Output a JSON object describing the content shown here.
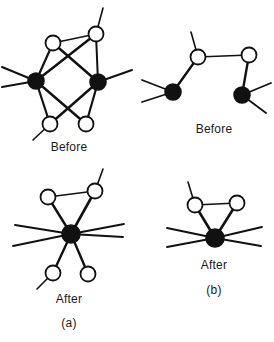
{
  "figure": {
    "width": 274,
    "height": 342,
    "background": "#ffffff",
    "ink_color": "#111111",
    "open_node_fill": "#ffffff",
    "filled_node_fill": "#111111"
  },
  "captions": [
    {
      "name": "caption-before-a",
      "text": "Before",
      "x": 69,
      "y": 140
    },
    {
      "name": "caption-before-b",
      "text": "Before",
      "x": 214,
      "y": 122
    },
    {
      "name": "caption-after-a",
      "text": "After",
      "x": 69,
      "y": 292
    },
    {
      "name": "caption-label-a",
      "text": "(a)",
      "x": 69,
      "y": 316
    },
    {
      "name": "caption-after-b",
      "text": "After",
      "x": 214,
      "y": 258
    },
    {
      "name": "caption-label-b",
      "text": "(b)",
      "x": 214,
      "y": 283
    }
  ],
  "panels": [
    {
      "name": "panel-before-a",
      "caption": "Before",
      "sublabel": "(a)",
      "nodes": [
        {
          "id": "u1",
          "type": "open",
          "cx": 53,
          "cy": 43,
          "r": 7.5
        },
        {
          "id": "u2",
          "type": "open",
          "cx": 96,
          "cy": 34,
          "r": 7.5
        },
        {
          "id": "d1",
          "type": "filled",
          "cx": 36,
          "cy": 81,
          "r": 8.0
        },
        {
          "id": "d2",
          "type": "filled",
          "cx": 98,
          "cy": 82,
          "r": 8.0
        },
        {
          "id": "l1",
          "type": "open",
          "cx": 50,
          "cy": 124,
          "r": 7.5
        },
        {
          "id": "l2",
          "type": "open",
          "cx": 86,
          "cy": 124,
          "r": 7.5
        }
      ],
      "edges": [
        {
          "from": "u1",
          "to": "u2",
          "weight": 1.6
        },
        {
          "from": "u1",
          "to": "d1",
          "weight": 2.2
        },
        {
          "from": "u1",
          "to": "d2",
          "weight": 2.4
        },
        {
          "from": "u2",
          "to": "d1",
          "weight": 2.4
        },
        {
          "from": "u2",
          "to": "d2",
          "weight": 2.0
        },
        {
          "from": "d1",
          "to": "l1",
          "weight": 2.2
        },
        {
          "from": "d1",
          "to": "l2",
          "weight": 2.4
        },
        {
          "from": "d2",
          "to": "l1",
          "weight": 2.4
        },
        {
          "from": "d2",
          "to": "l2",
          "weight": 2.2
        }
      ],
      "stubs": [
        {
          "from": "u2",
          "dx": 7,
          "dy": -26,
          "weight": 1.6
        },
        {
          "from": "d1",
          "dx": -34,
          "dy": -14,
          "weight": 2.0
        },
        {
          "from": "d1",
          "dx": -34,
          "dy": 6,
          "weight": 2.0
        },
        {
          "from": "d2",
          "dx": 34,
          "dy": -12,
          "weight": 2.0
        },
        {
          "from": "l1",
          "dx": -17,
          "dy": 16,
          "weight": 1.6
        }
      ]
    },
    {
      "name": "panel-before-b",
      "caption": "Before",
      "sublabel": "(b)",
      "nodes": [
        {
          "id": "w1",
          "type": "open",
          "cx": 198,
          "cy": 57,
          "r": 7.5
        },
        {
          "id": "w2",
          "type": "open",
          "cx": 249,
          "cy": 55,
          "r": 7.5
        },
        {
          "id": "b1",
          "type": "filled",
          "cx": 173,
          "cy": 92,
          "r": 8.0
        },
        {
          "id": "b2",
          "type": "filled",
          "cx": 242,
          "cy": 95,
          "r": 8.0
        }
      ],
      "edges": [
        {
          "from": "w1",
          "to": "w2",
          "weight": 1.4
        },
        {
          "from": "w1",
          "to": "b1",
          "weight": 2.4
        },
        {
          "from": "w2",
          "to": "b2",
          "weight": 2.4
        }
      ],
      "stubs": [
        {
          "from": "w1",
          "dx": -7,
          "dy": -25,
          "weight": 1.6
        },
        {
          "from": "b1",
          "dx": -31,
          "dy": -12,
          "weight": 1.8
        },
        {
          "from": "b1",
          "dx": -31,
          "dy": 10,
          "weight": 1.8
        },
        {
          "from": "b2",
          "dx": 29,
          "dy": -12,
          "weight": 1.8
        },
        {
          "from": "b2",
          "dx": 24,
          "dy": 18,
          "weight": 1.8
        }
      ]
    },
    {
      "name": "panel-after-a",
      "caption": "After",
      "sublabel": "(a)",
      "nodes": [
        {
          "id": "t1",
          "type": "open",
          "cx": 48,
          "cy": 197,
          "r": 7.5
        },
        {
          "id": "t2",
          "type": "open",
          "cx": 95,
          "cy": 191,
          "r": 7.5
        },
        {
          "id": "hub",
          "type": "filled",
          "cx": 71,
          "cy": 234,
          "r": 9.0
        },
        {
          "id": "p1",
          "type": "open",
          "cx": 53,
          "cy": 273,
          "r": 7.5
        },
        {
          "id": "p2",
          "type": "open",
          "cx": 88,
          "cy": 274,
          "r": 7.5
        }
      ],
      "edges": [
        {
          "from": "t1",
          "to": "t2",
          "weight": 1.5
        },
        {
          "from": "t1",
          "to": "hub",
          "weight": 2.4
        },
        {
          "from": "t2",
          "to": "hub",
          "weight": 2.6
        },
        {
          "from": "hub",
          "to": "p1",
          "weight": 2.4
        },
        {
          "from": "hub",
          "to": "p2",
          "weight": 2.4
        }
      ],
      "stubs": [
        {
          "from": "t2",
          "dx": 8,
          "dy": -22,
          "weight": 1.6
        },
        {
          "from": "hub",
          "dx": -56,
          "dy": -9,
          "weight": 1.8
        },
        {
          "from": "hub",
          "dx": -58,
          "dy": 12,
          "weight": 1.8
        },
        {
          "from": "hub",
          "dx": 53,
          "dy": -10,
          "weight": 1.8
        },
        {
          "from": "hub",
          "dx": 52,
          "dy": 3,
          "weight": 1.8
        },
        {
          "from": "p1",
          "dx": -16,
          "dy": 16,
          "weight": 1.6
        }
      ]
    },
    {
      "name": "panel-after-b",
      "caption": "After",
      "sublabel": "(b)",
      "nodes": [
        {
          "id": "s1",
          "type": "open",
          "cx": 195,
          "cy": 205,
          "r": 7.5
        },
        {
          "id": "s2",
          "type": "open",
          "cx": 237,
          "cy": 203,
          "r": 7.5
        },
        {
          "id": "hub2",
          "type": "filled",
          "cx": 215,
          "cy": 238,
          "r": 9.0
        }
      ],
      "edges": [
        {
          "from": "s1",
          "to": "s2",
          "weight": 1.4
        },
        {
          "from": "s1",
          "to": "hub2",
          "weight": 2.6
        },
        {
          "from": "s2",
          "to": "hub2",
          "weight": 2.6
        }
      ],
      "stubs": [
        {
          "from": "s1",
          "dx": -7,
          "dy": -23,
          "weight": 1.6
        },
        {
          "from": "hub2",
          "dx": -48,
          "dy": -10,
          "weight": 1.8
        },
        {
          "from": "hub2",
          "dx": -48,
          "dy": 9,
          "weight": 1.8
        },
        {
          "from": "hub2",
          "dx": 47,
          "dy": -11,
          "weight": 1.8
        },
        {
          "from": "hub2",
          "dx": 46,
          "dy": 8,
          "weight": 1.8
        }
      ]
    }
  ]
}
